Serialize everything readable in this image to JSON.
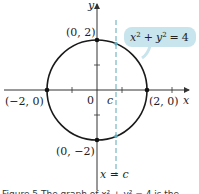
{
  "diagram": {
    "equation_label": "x² + y² = 4",
    "equation_parts": {
      "x": "x",
      "sup": "2",
      "plus": "+",
      "y": "y",
      "eq": "=",
      "rhs": "4"
    },
    "axis_labels": {
      "x": "x",
      "y": "y"
    },
    "origin_label": "0",
    "c_label": "c",
    "line_label": "x = c",
    "points": [
      {
        "label": "(0, 2)"
      },
      {
        "label": "(−2, 0)"
      },
      {
        "label": "(2, 0)"
      },
      {
        "label": "(0, −2)"
      }
    ],
    "caption": "Figure 5  The graph of x² + y² = 4 is the"
  },
  "colors": {
    "curve": "#1a1a1a",
    "axis": "#333333",
    "dashed_line": "#5aa7b8",
    "label_box": "#c8e4ec"
  }
}
